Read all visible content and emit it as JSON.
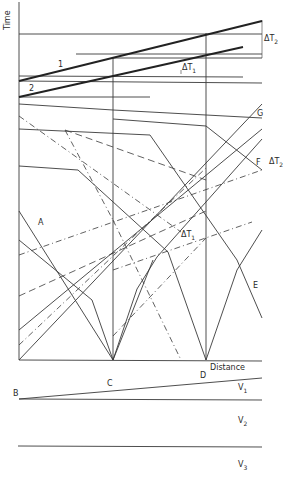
{
  "axes": {
    "y_label": "Time",
    "x_label": "Distance"
  },
  "traveltime_labels": {
    "line1": "1",
    "line2": "2",
    "delta_t1_top": "ΔT",
    "delta_t1_top_sub": "1",
    "delta_t2_top": "ΔT",
    "delta_t2_top_sub": "2",
    "delta_t2_right": "ΔT",
    "delta_t2_right_sub": "2",
    "delta_t1_mid": "ΔT",
    "delta_t1_mid_sub": "1",
    "A": "A",
    "E": "E",
    "F": "F",
    "G": "G"
  },
  "section": {
    "B": "B",
    "C": "C",
    "D": "D",
    "layers": [
      {
        "label": "V",
        "sub": "1"
      },
      {
        "label": "V",
        "sub": "2"
      },
      {
        "label": "V",
        "sub": "3"
      }
    ]
  },
  "colors": {
    "line": "#2b2b2b",
    "thin": "#555555",
    "background": "#ffffff"
  }
}
